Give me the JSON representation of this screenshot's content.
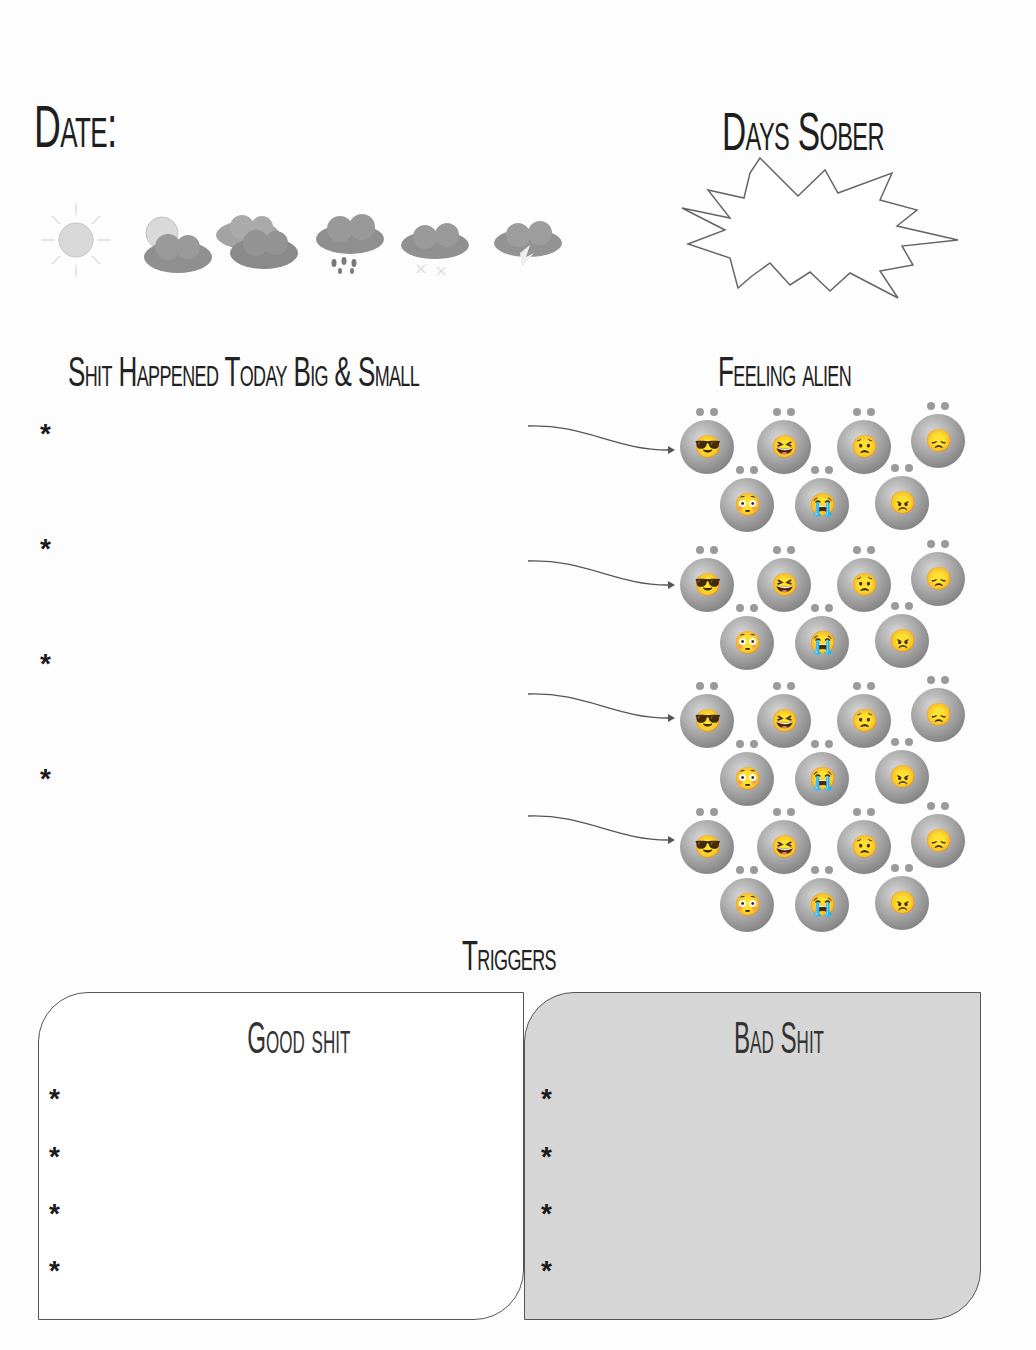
{
  "header": {
    "date_label": "Date:",
    "days_sober_label": "Days Sober",
    "weather_icons": [
      "sunny-icon",
      "partly-cloudy-icon",
      "cloudy-icon",
      "rain-icon",
      "snow-icon",
      "thunderstorm-icon"
    ]
  },
  "events": {
    "title": "Shit Happened Today Big & Small",
    "bullets": [
      "*",
      "*",
      "*",
      "*"
    ]
  },
  "feelings": {
    "title": "Feeling alien",
    "rows": 4,
    "faces": [
      "cool",
      "laughing",
      "worried",
      "sad",
      "shocked",
      "crying",
      "angry"
    ],
    "face_glyphs": [
      "😎",
      "😆",
      "😟",
      "😞",
      "😳",
      "😭",
      "😠"
    ]
  },
  "triggers": {
    "title": "Triggers",
    "good": {
      "title": "Good shit",
      "bullets": [
        "*",
        "*",
        "*",
        "*"
      ]
    },
    "bad": {
      "title": "Bad Shit",
      "bullets": [
        "*",
        "*",
        "*",
        "*"
      ]
    }
  },
  "colors": {
    "bad_box_fill": "#d6d6d6",
    "border": "#555555"
  }
}
